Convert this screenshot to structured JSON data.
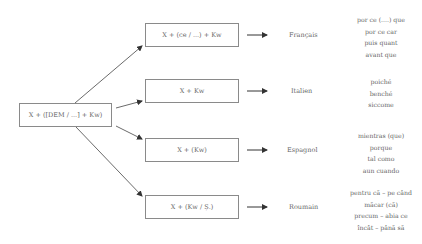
{
  "source": {
    "label": "X + ([DEM / ...] + Kw)"
  },
  "branches": [
    {
      "formula": "X + (ce / ...) + Kw",
      "language": "Français",
      "conjunctions": [
        "por ce (....) que",
        "por ce car",
        "puis quant",
        "avant que"
      ]
    },
    {
      "formula": "X + Kw",
      "language": "Italien",
      "conjunctions": [
        "poiché",
        "benché",
        "siccome"
      ]
    },
    {
      "formula": "X + (Kw)",
      "language": "Espagnol",
      "conjunctions": [
        "mientras (que)",
        "porque",
        "tal como",
        "aun cuando"
      ]
    },
    {
      "formula": "X + (Kw / Ș.)",
      "language": "Roumain",
      "conjunctions": [
        "pentru că – pe când",
        "măcar (că)",
        "precum – abia ce",
        "încât – până să"
      ]
    }
  ],
  "colors": {
    "line": "#333333",
    "box_border": "#8a8a8a",
    "text": "#666666"
  }
}
